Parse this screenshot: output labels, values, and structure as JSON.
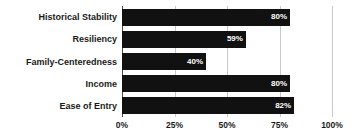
{
  "chart_data": {
    "type": "bar",
    "orientation": "horizontal",
    "title": "",
    "subtitle": "",
    "xlabel": "",
    "ylabel": "",
    "categories": [
      "Historical Stability",
      "Resiliency",
      "Family-Centeredness",
      "Income",
      "Ease of Entry"
    ],
    "values": [
      80,
      59,
      40,
      80,
      82
    ],
    "value_labels": [
      "80%",
      "59%",
      "40%",
      "80%",
      "82%"
    ],
    "xlim": [
      0,
      100
    ],
    "xticks": [
      0,
      25,
      50,
      75,
      100
    ],
    "xtick_labels": [
      "0%",
      "25%",
      "50%",
      "75%",
      "100%"
    ],
    "grid": true,
    "grid_axis": "x",
    "legend": false,
    "bar_color": "#111111",
    "value_label_color": "#ffffff",
    "grid_color": "#c9c9c9",
    "axis_color": "#4a4a4a",
    "background_color": "#ffffff"
  }
}
